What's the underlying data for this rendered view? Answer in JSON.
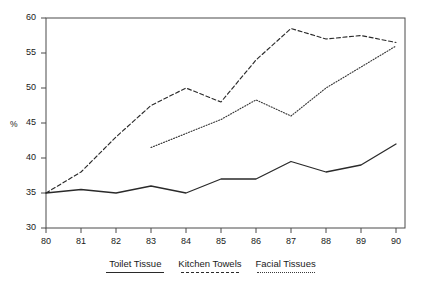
{
  "top_truncated_text": "",
  "chart_data": {
    "type": "line",
    "title": "",
    "xlabel": "",
    "ylabel": "%",
    "x": [
      80,
      81,
      82,
      83,
      84,
      85,
      86,
      87,
      88,
      89,
      90
    ],
    "xlim": [
      80,
      90
    ],
    "ylim": [
      30,
      60
    ],
    "yticks": [
      30,
      35,
      40,
      45,
      50,
      55,
      60
    ],
    "xticks": [
      80,
      81,
      82,
      83,
      84,
      85,
      86,
      87,
      88,
      89,
      90
    ],
    "grid": false,
    "legend_position": "bottom",
    "series": [
      {
        "name": "Toilet Tissue",
        "style": "solid",
        "color": "#2a2a2a",
        "x": [
          80,
          81,
          82,
          83,
          84,
          85,
          86,
          87,
          88,
          89,
          90
        ],
        "values": [
          35.0,
          35.5,
          35.0,
          36.0,
          35.0,
          37.0,
          37.0,
          39.5,
          38.0,
          39.0,
          42.0
        ]
      },
      {
        "name": "Kitchen Towels",
        "style": "dashed",
        "color": "#2a2a2a",
        "x": [
          80,
          81,
          82,
          83,
          84,
          85,
          86,
          87,
          88,
          89,
          90
        ],
        "values": [
          35.0,
          38.0,
          43.0,
          47.5,
          50.0,
          48.0,
          54.0,
          58.5,
          57.0,
          57.5,
          56.5
        ]
      },
      {
        "name": "Facial Tissues",
        "style": "dotted",
        "color": "#3a3a3a",
        "x": [
          83,
          84,
          85,
          86,
          87,
          88,
          89,
          90
        ],
        "values": [
          41.5,
          43.5,
          45.5,
          48.3,
          46.0,
          50.0,
          53.0,
          56.0
        ]
      }
    ]
  },
  "axis": {
    "y_ticklabels": [
      "60",
      "55",
      "50",
      "45",
      "40",
      "35",
      "30"
    ],
    "x_ticklabels": [
      "80",
      "81",
      "82",
      "83",
      "84",
      "85",
      "86",
      "87",
      "88",
      "89",
      "90"
    ],
    "y_title": "%"
  },
  "legend": {
    "items": [
      {
        "label": "Toilet Tissue",
        "style": "solid"
      },
      {
        "label": "Kitchen Towels",
        "style": "dashed"
      },
      {
        "label": "Facial Tissues",
        "style": "dotted"
      }
    ]
  }
}
